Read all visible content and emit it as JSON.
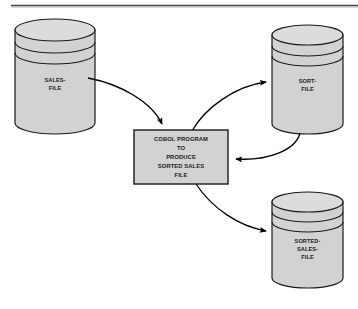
{
  "diagram": {
    "title_rule": "horizontal-rule",
    "background_color": "#ffffff",
    "shape_fill_color": "#d2d2d2",
    "shape_stroke_color": "#1a1a1a",
    "arrow_color": "#000000",
    "nodes": [
      {
        "id": "sales-file",
        "type": "cylinder",
        "label_lines": [
          "SALES-",
          "FILE"
        ]
      },
      {
        "id": "sort-file",
        "type": "cylinder",
        "label_lines": [
          "SORT-",
          "FILE"
        ]
      },
      {
        "id": "sorted-sales-file",
        "type": "cylinder",
        "label_lines": [
          "SORTED-",
          "SALES-",
          "FILE"
        ]
      },
      {
        "id": "cobol-program",
        "type": "process-box",
        "label_lines": [
          "COBOL PROGRAM",
          "TO",
          "PRODUCE",
          "SORTED SALES",
          "FILE"
        ]
      }
    ],
    "edges": [
      {
        "id": "sales-to-program",
        "from": "sales-file",
        "to": "cobol-program"
      },
      {
        "id": "program-to-sort",
        "from": "cobol-program",
        "to": "sort-file"
      },
      {
        "id": "sort-to-program",
        "from": "sort-file",
        "to": "cobol-program"
      },
      {
        "id": "program-to-sorted-sales",
        "from": "cobol-program",
        "to": "sorted-sales-file"
      }
    ]
  },
  "labels": {
    "sales_file_1": "SALES-",
    "sales_file_2": "FILE",
    "sort_file_1": "SORT-",
    "sort_file_2": "FILE",
    "sorted_sales_1": "SORTED-",
    "sorted_sales_2": "SALES-",
    "sorted_sales_3": "FILE",
    "program_1": "COBOL PROGRAM",
    "program_2": "TO",
    "program_3": "PRODUCE",
    "program_4": "SORTED SALES",
    "program_5": "FILE"
  }
}
